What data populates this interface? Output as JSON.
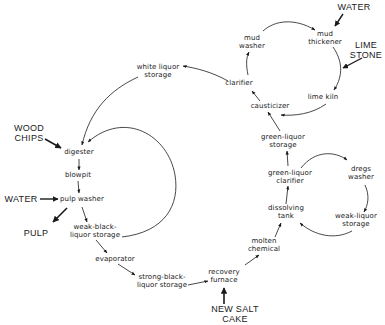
{
  "diagram": {
    "type": "process-flow",
    "title": "",
    "nodes": {
      "white_liquor_storage": [
        "white liquor",
        "storage"
      ],
      "digester": [
        "digester"
      ],
      "blowpit": [
        "blowpit"
      ],
      "pulp_washer": [
        "pulp washer"
      ],
      "weak_black_liquor_storage": [
        "weak-black-",
        "liquor storage"
      ],
      "evaporator": [
        "evaporator"
      ],
      "strong_black_liquor_storage": [
        "strong-black-",
        "liquor storage"
      ],
      "recovery_furnace": [
        "recovery",
        "furnace"
      ],
      "molten_chemical": [
        "molten",
        "chemical"
      ],
      "dissolving_tank": [
        "dissolving",
        "tank"
      ],
      "green_liquor_clarifier": [
        "green-liquor",
        "clarifier"
      ],
      "dregs_washer": [
        "dregs",
        "washer"
      ],
      "weak_liquor_storage": [
        "weak-liquor",
        "storage"
      ],
      "green_liquor_storage": [
        "green-liquor",
        "storage"
      ],
      "causticizer": [
        "causticizer"
      ],
      "clarifier": [
        "clarifier"
      ],
      "mud_washer": [
        "mud",
        "washer"
      ],
      "mud_thickener": [
        "mud",
        "thickener"
      ],
      "lime_kiln": [
        "lime kiln"
      ]
    },
    "inputs_outputs": {
      "wood_chips": [
        "WOOD",
        "CHIPS"
      ],
      "water_left": [
        "WATER"
      ],
      "pulp": [
        "PULP"
      ],
      "water_top": [
        "WATER"
      ],
      "lime_stone": [
        "LIME",
        "STONE"
      ],
      "new_salt_cake": [
        "NEW SALT",
        "CAKE"
      ]
    },
    "edges": [
      [
        "wood_chips",
        "digester"
      ],
      [
        "white_liquor_storage",
        "digester"
      ],
      [
        "weak_black_liquor_storage",
        "digester"
      ],
      [
        "digester",
        "blowpit"
      ],
      [
        "blowpit",
        "pulp_washer"
      ],
      [
        "water_left",
        "pulp_washer"
      ],
      [
        "pulp_washer",
        "pulp"
      ],
      [
        "pulp_washer",
        "weak_black_liquor_storage"
      ],
      [
        "weak_black_liquor_storage",
        "evaporator"
      ],
      [
        "evaporator",
        "strong_black_liquor_storage"
      ],
      [
        "strong_black_liquor_storage",
        "recovery_furnace"
      ],
      [
        "new_salt_cake",
        "recovery_furnace"
      ],
      [
        "recovery_furnace",
        "molten_chemical"
      ],
      [
        "molten_chemical",
        "dissolving_tank"
      ],
      [
        "dissolving_tank",
        "green_liquor_clarifier"
      ],
      [
        "green_liquor_clarifier",
        "dregs_washer"
      ],
      [
        "dregs_washer",
        "weak_liquor_storage"
      ],
      [
        "weak_liquor_storage",
        "dissolving_tank"
      ],
      [
        "green_liquor_clarifier",
        "green_liquor_storage"
      ],
      [
        "green_liquor_storage",
        "causticizer"
      ],
      [
        "causticizer",
        "clarifier"
      ],
      [
        "clarifier",
        "white_liquor_storage"
      ],
      [
        "clarifier",
        "mud_washer"
      ],
      [
        "mud_washer",
        "mud_thickener"
      ],
      [
        "water_top",
        "mud_thickener"
      ],
      [
        "mud_thickener",
        "lime_kiln"
      ],
      [
        "lime_stone",
        "lime_kiln"
      ],
      [
        "lime_kiln",
        "causticizer"
      ]
    ],
    "colors": {
      "ink": "#1a1a1a",
      "background": "#ffffff"
    }
  }
}
